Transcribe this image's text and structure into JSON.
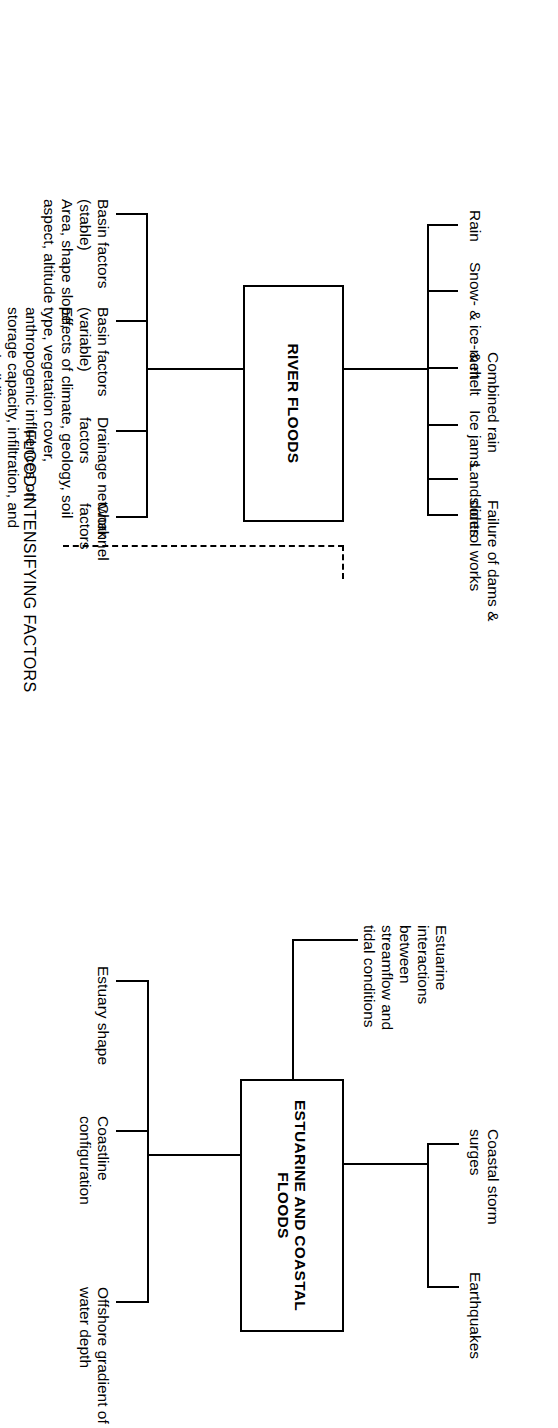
{
  "diagram": {
    "type": "flowchart",
    "caption": "FLOOD-INTENSIFYING FACTORS",
    "nodes": {
      "river_floods": "RIVER FLOODS",
      "estuarine_coastal_floods": "ESTUARINE AND\nCOASTAL FLOODS"
    },
    "river_causes": [
      "Rain",
      "Snow- & ice-melt",
      "Combined rain\n& melt",
      "Ice jams",
      "Landslides",
      "Failure of dams &\ncontrol works"
    ],
    "estuarine_causes": [
      "Estuarine\ninteractions\nbetween\nstreamflow and\ntidal conditions",
      "Coastal storm\nsurges",
      "Earthquakes"
    ],
    "river_factors": [
      "Basin factors\n(stable)\nArea, shape slope,\naspect, altitude",
      "Basin factors\n(variable)\nEffects of climate, geology, soil\ntype, vegetation cover,\nanthropogenic influences on\nstorage capacity, infiltration, and\ntransmissibility",
      "Drainage network\nfactors",
      "Channel\nfactors"
    ],
    "estuarine_factors": [
      "Estuary shape",
      "Coastline\nconfiguration",
      "Offshore gradient of\nwater depth"
    ],
    "link_label": "dashed-link-river-to-estuarine",
    "colors": {
      "line": "#000000",
      "background": "#ffffff",
      "text": "#000000"
    }
  }
}
